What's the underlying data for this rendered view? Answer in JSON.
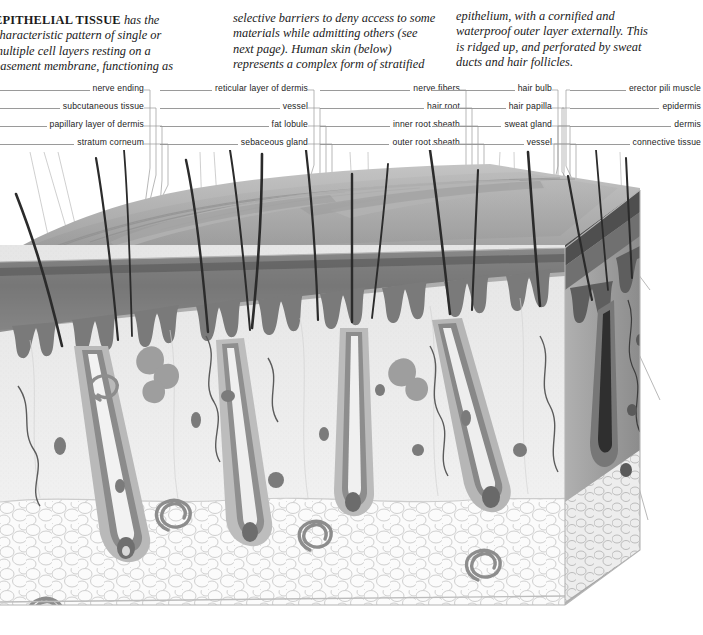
{
  "page": {
    "figure_caption": "Human skin (below) represents a complex form of stratified epithelium"
  },
  "body_text": {
    "column_1": [
      "EPITHELIAL TISSUE has the",
      "characteristic pattern of single or",
      "multiple cell layers resting on a",
      "basement membrane, functioning as"
    ],
    "column_1_lead": "EPITHELIAL TISSUE",
    "column_1_rest": [
      " has the",
      "characteristic pattern of single or",
      "multiple cell layers resting on a",
      "basement membrane, functioning as"
    ],
    "column_2": [
      "selective barriers to deny access to some",
      "materials while admitting others (see",
      "next page). Human skin (below)",
      "represents a complex form of stratified"
    ],
    "column_3": [
      "epithelium, with a cornified and",
      "waterproof outer layer externally. This",
      "is ridged up, and perforated by sweat",
      "ducts and hair follicles."
    ]
  },
  "label_groups": [
    {
      "name": "group-left",
      "labels": [
        "nerve ending",
        "subcutaneous tissue",
        "papillary layer of dermis",
        "stratum corneum"
      ]
    },
    {
      "name": "group-two",
      "labels": [
        "reticular layer of dermis",
        "vessel",
        "fat lobule",
        "sebaceous gland"
      ]
    },
    {
      "name": "group-three",
      "labels": [
        "nerve fibers",
        "hair root",
        "inner root sheath",
        "outer root sheath"
      ]
    },
    {
      "name": "group-four",
      "labels": [
        "hair bulb",
        "hair papilla",
        "sweat gland",
        "vessel"
      ]
    },
    {
      "name": "group-right",
      "labels": [
        "erector pili muscle",
        "epidermis",
        "dermis",
        "connective tissue"
      ]
    }
  ],
  "colors": {
    "page_background": "#ffffff",
    "text": "#1b1b1b",
    "leader_line": "#8e8e8e",
    "hair_shaft": "#2a2a2a",
    "skin_surface": "#a8a8a8",
    "epidermis_band": "#6e6e6e",
    "dermis": "#cfcfcf",
    "fat_layer": "#f2f2f2",
    "cut_face": "#9a9a9a"
  },
  "illustration": {
    "name": "skin-block-diagram",
    "type": "histological 3d block",
    "layers": [
      "epidermis",
      "dermis",
      "subcutaneous fat"
    ],
    "structures": [
      "hair shaft",
      "hair follicle",
      "sebaceous gland",
      "sweat gland",
      "vessel",
      "nerve"
    ]
  }
}
